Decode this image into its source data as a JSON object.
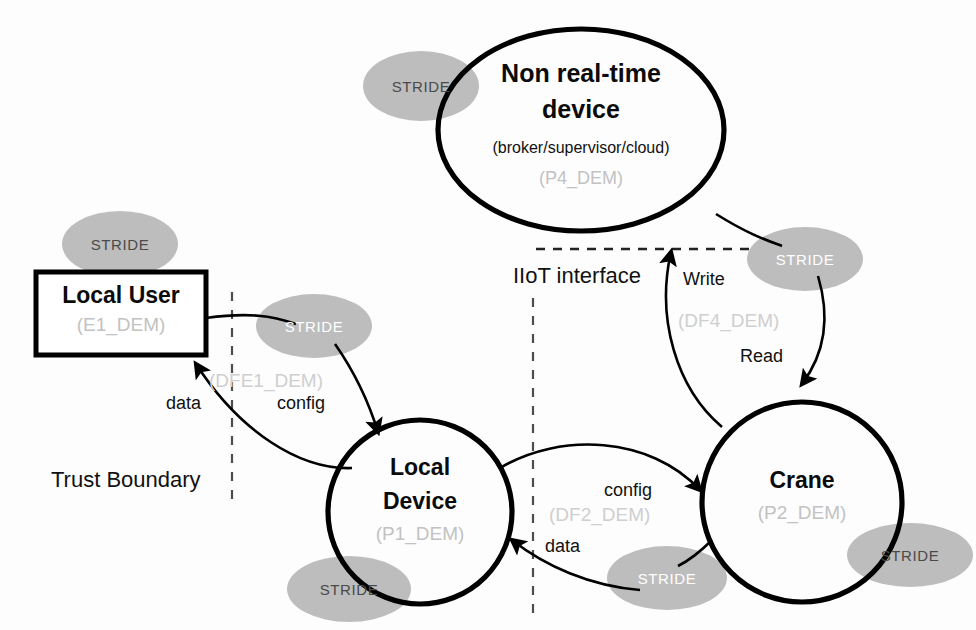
{
  "diagram": {
    "title_region": "IIoT crane data flow diagram with STRIDE threat annotations",
    "colors": {
      "stroke": "#000000",
      "stride_fill": "#bdbdbd",
      "stride_label": "#4a4a4a",
      "id_text": "#c9c9c9",
      "boundary": "#555555",
      "background": "#fdfdfd"
    }
  },
  "nodes": [
    {
      "key": "non_realtime_device",
      "shape": "ellipse",
      "title_line1": "Non real-time",
      "title_line2": "device",
      "subtitle": "(broker/supervisor/cloud)",
      "id": "(P4_DEM)"
    },
    {
      "key": "local_user",
      "shape": "rectangle",
      "title": "Local User",
      "id": "(E1_DEM)"
    },
    {
      "key": "local_device",
      "shape": "circle",
      "title_line1": "Local",
      "title_line2": "Device",
      "id": "(P1_DEM)"
    },
    {
      "key": "crane",
      "shape": "circle",
      "title": "Crane",
      "id": "(P2_DEM)"
    }
  ],
  "boundaries": [
    {
      "key": "iiot_interface",
      "label": "IIoT interface",
      "style": "dashed-horizontal"
    },
    {
      "key": "trust_boundary",
      "label": "Trust Boundary",
      "style": "dashed-vertical"
    },
    {
      "key": "trust_boundary_right",
      "label": "",
      "style": "dashed-vertical"
    }
  ],
  "flows": [
    {
      "key": "dfe1",
      "id": "(DFE1_DEM)",
      "label_out": "config",
      "label_in": "data"
    },
    {
      "key": "df2",
      "id": "(DF2_DEM)",
      "label_out": "config",
      "label_in": "data"
    },
    {
      "key": "df4",
      "id": "(DF4_DEM)",
      "label_out": "Write",
      "label_in": "Read"
    }
  ],
  "stride_badges": [
    {
      "key": "stride-non-realtime-device",
      "label": "STRIDE",
      "variant": "dark"
    },
    {
      "key": "stride-local-user",
      "label": "STRIDE",
      "variant": "mixed"
    },
    {
      "key": "stride-dfe1",
      "label": "STRIDE",
      "variant": "light"
    },
    {
      "key": "stride-df4",
      "label": "STRIDE",
      "variant": "light"
    },
    {
      "key": "stride-local-device",
      "label": "STRIDE",
      "variant": "dark"
    },
    {
      "key": "stride-df2",
      "label": "STRIDE",
      "variant": "light"
    },
    {
      "key": "stride-crane",
      "label": "STRIDE",
      "variant": "dark"
    }
  ]
}
